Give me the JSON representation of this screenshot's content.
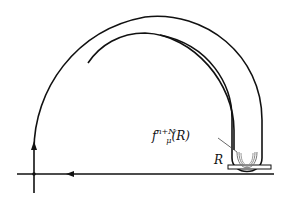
{
  "diagram": {
    "labels": {
      "iterate_base": "f",
      "iterate_sub": "μ",
      "iterate_sup": "n+N",
      "iterate_arg": "(R)",
      "rectangle": "R"
    },
    "colors": {
      "stroke": "#111111",
      "background": "#ffffff"
    }
  }
}
